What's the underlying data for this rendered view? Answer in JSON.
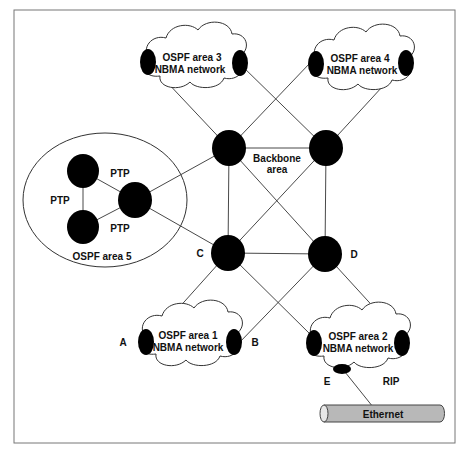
{
  "diagram": {
    "type": "network-topology",
    "backbone": {
      "label_line1": "Backbone",
      "label_line2": "area"
    },
    "clouds": [
      {
        "id": "area3",
        "line1": "OSPF area 3",
        "line2": "NBMA network"
      },
      {
        "id": "area4",
        "line1": "OSPF area 4",
        "line2": "NBMA network"
      },
      {
        "id": "area1",
        "line1": "OSPF area 1",
        "line2": "NBMA network"
      },
      {
        "id": "area2",
        "line1": "OSPF area 2",
        "line2": "NBMA network"
      }
    ],
    "area5": {
      "label": "OSPF area 5",
      "ptp_labels": [
        "PTP",
        "PTP",
        "PTP"
      ]
    },
    "router_labels": {
      "A": "A",
      "B": "B",
      "C": "C",
      "D": "D",
      "E": "E"
    },
    "rip_label": "RIP",
    "ethernet_label": "Ethernet",
    "colors": {
      "router": "#000000",
      "line": "#333333",
      "ethernet": "#b8b8b8",
      "border": "#777777"
    }
  }
}
